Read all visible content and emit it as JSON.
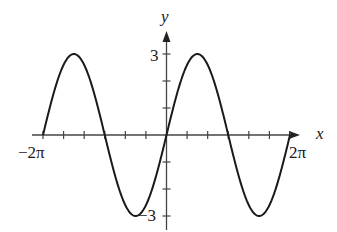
{
  "chart_data": {
    "type": "line",
    "title": "",
    "function": "y = 3 sin(x)",
    "xlabel": "x",
    "ylabel": "y",
    "xlim": [
      "-2π",
      "2π"
    ],
    "ylim": [
      -3,
      3
    ],
    "x_tick_interval": "π/3",
    "y_tick_interval": 1,
    "x_tick_labels": [
      {
        "value": "-2π",
        "label": "−2π"
      },
      {
        "value": "2π",
        "label": "2π"
      }
    ],
    "y_tick_labels": [
      {
        "value": 3,
        "label": "3"
      },
      {
        "value": -3,
        "label": "−3"
      }
    ],
    "series": [
      {
        "name": "3 sin x",
        "x": [
          "-2π",
          "-3π/2",
          "-π",
          "-π/2",
          "0",
          "π/2",
          "π",
          "3π/2",
          "2π"
        ],
        "values": [
          0,
          3,
          0,
          -3,
          0,
          3,
          0,
          -3,
          0
        ]
      }
    ],
    "amplitude": 3,
    "period": "2π",
    "grid": false,
    "legend": null,
    "color": "#1a1a1a"
  },
  "labels": {
    "x_axis": "x",
    "y_axis": "y",
    "y_max": "3",
    "y_min": "−3",
    "x_min": "−2π",
    "x_max": "2π"
  }
}
